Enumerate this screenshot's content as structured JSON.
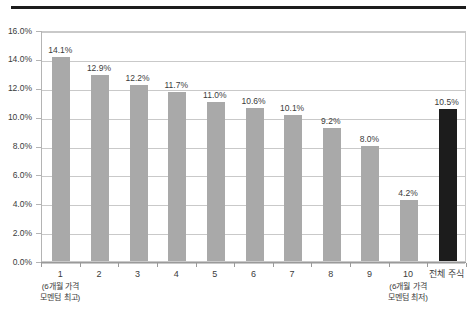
{
  "chart_data": {
    "type": "bar",
    "title": "",
    "xlabel": "",
    "ylabel": "",
    "ylim": [
      0.0,
      16.0
    ],
    "y_tick_labels": [
      "16.0%",
      "14.0%",
      "12.0%",
      "10.0%",
      "8.0%",
      "6.0%",
      "4.0%",
      "2.0%",
      "0.0%"
    ],
    "y_tick_values": [
      16.0,
      14.0,
      12.0,
      10.0,
      8.0,
      6.0,
      4.0,
      2.0,
      0.0
    ],
    "grid": true,
    "legend": "none",
    "categories": [
      "1",
      "2",
      "3",
      "4",
      "5",
      "6",
      "7",
      "8",
      "9",
      "10",
      "전체 주식"
    ],
    "values": [
      14.1,
      12.9,
      12.2,
      11.7,
      11.0,
      10.6,
      10.1,
      9.2,
      8.0,
      4.2,
      10.5
    ],
    "data_labels": [
      "14.1%",
      "12.9%",
      "12.2%",
      "11.7%",
      "11.0%",
      "10.6%",
      "10.1%",
      "9.2%",
      "8.0%",
      "4.2%",
      "10.5%"
    ],
    "bar_colors": [
      "#a9a9a9",
      "#a9a9a9",
      "#a9a9a9",
      "#a9a9a9",
      "#a9a9a9",
      "#a9a9a9",
      "#a9a9a9",
      "#a9a9a9",
      "#a9a9a9",
      "#a9a9a9",
      "#1c1c1c"
    ],
    "annotations": [
      {
        "category": "1",
        "line1": "(6개월 가격",
        "line2": "모멘텀 최고)"
      },
      {
        "category": "10",
        "line1": "(6개월 가격",
        "line2": "모멘텀 최저)"
      }
    ]
  },
  "colors": {
    "bar_default": "#a9a9a9",
    "bar_highlight": "#1c1c1c",
    "gridline": "#c9c9c9",
    "axis": "#9a9a9a",
    "text": "#3b3b3b",
    "top_rule": "#1c1c1c",
    "background": "#ffffff"
  }
}
